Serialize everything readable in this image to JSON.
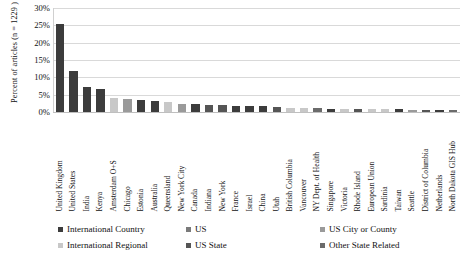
{
  "chart_data": {
    "type": "bar",
    "title": "",
    "xlabel": "",
    "ylabel": "Percent of articles (n = 1229 )",
    "ylim": [
      0,
      30
    ],
    "ytick_labels": [
      "30%",
      "25%",
      "20%",
      "15%",
      "10%",
      "5%",
      "0%"
    ],
    "ytick_values": [
      30,
      25,
      20,
      15,
      10,
      5,
      0
    ],
    "grid": "horizontal",
    "legend_position": "bottom",
    "categories": [
      "United Kingdom",
      "United States",
      "India",
      "Kenya",
      "Amsterdam O+S",
      "Chicago",
      "Estonia",
      "Australia",
      "Queensland",
      "New York City",
      "Canada",
      "Indiana",
      "New York",
      "France",
      "Israel",
      "China",
      "Utah",
      "British Columbia",
      "Vancouver",
      "NY Dept. of Health",
      "Singapore",
      "Victoria",
      "Rhode Island",
      "European Union",
      "Sardinia",
      "Taiwan",
      "Seattle",
      "District of Columbia",
      "Netherlands",
      "North Dakota GIS Hub"
    ],
    "values": [
      25.5,
      11.8,
      7.1,
      6.5,
      3.9,
      3.8,
      3.5,
      3.1,
      2.9,
      2.3,
      2.2,
      2.1,
      1.9,
      1.8,
      1.7,
      1.6,
      1.5,
      1.3,
      1.2,
      1.1,
      1.0,
      1.0,
      0.9,
      0.9,
      0.8,
      0.8,
      0.7,
      0.6,
      0.6,
      0.5
    ],
    "point_series": [
      "International Country",
      "International Country",
      "International Country",
      "International Country",
      "International Regional",
      "US City or County",
      "International Country",
      "International Country",
      "International Regional",
      "US City or County",
      "International Country",
      "US State",
      "US State",
      "International Country",
      "International Country",
      "International Country",
      "US State",
      "International Regional",
      "International Regional",
      "Other State Related",
      "International Country",
      "International Regional",
      "US State",
      "International Regional",
      "International Regional",
      "International Country",
      "US City or County",
      "US State",
      "International Country",
      "Other State Related"
    ],
    "legend": [
      {
        "label": "International Country",
        "color": "#3c3c3c"
      },
      {
        "label": "International Regional",
        "color": "#c8c8c8"
      },
      {
        "label": "US",
        "color": "#7a7a7a"
      },
      {
        "label": "US State",
        "color": "#555555"
      },
      {
        "label": "US City or County",
        "color": "#9a9a9a"
      },
      {
        "label": "Other State Related",
        "color": "#6b6b6b"
      }
    ],
    "legend_columns": [
      [
        "International Country",
        "International Regional"
      ],
      [
        "US",
        "US State"
      ],
      [
        "US City or County",
        "Other State Related"
      ]
    ]
  }
}
